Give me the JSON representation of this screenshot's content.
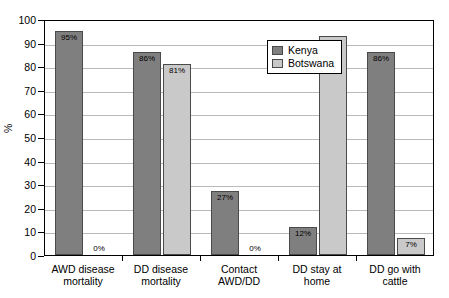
{
  "chart_data": {
    "type": "bar",
    "title": "",
    "xlabel": "",
    "ylabel": "%",
    "ylim": [
      0,
      100
    ],
    "ytick_step": 10,
    "yticks": [
      100,
      90,
      80,
      70,
      60,
      50,
      40,
      30,
      20,
      10,
      0
    ],
    "grid": true,
    "legend_position": "top-right-inside",
    "categories": [
      "AWD disease\nmortality",
      "DD disease\nmortality",
      "Contact\nAWD/DD",
      "DD stay at\nhome",
      "DD go with\ncattle"
    ],
    "series": [
      {
        "name": "Kenya",
        "color": "#7f7f7f",
        "values": [
          95,
          86,
          27,
          12,
          86
        ],
        "labels": [
          "95%",
          "86%",
          "27%",
          "12%",
          "86%"
        ]
      },
      {
        "name": "Botswana",
        "color": "#c9c9c9",
        "values": [
          0,
          81,
          0,
          93,
          7
        ],
        "labels": [
          "0%",
          "81%",
          "0%",
          "93%",
          "7%"
        ]
      }
    ]
  },
  "legend": {
    "items": [
      {
        "label": "Kenya"
      },
      {
        "label": "Botswana"
      }
    ]
  },
  "colors": {
    "kenya": "#7f7f7f",
    "botswana": "#c9c9c9",
    "gridline": "#b9b9b9",
    "axis": "#000000"
  }
}
